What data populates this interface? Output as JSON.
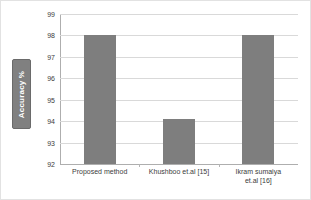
{
  "chart_data": {
    "type": "bar",
    "title": "",
    "xlabel": "",
    "ylabel": "Accuracy %",
    "categories": [
      "Proposed method",
      "Khushboo et.al [15]",
      "Ikram sumaiya et.al [16]"
    ],
    "category_lines": [
      [
        "Proposed method"
      ],
      [
        "Khushboo et.al [15]"
      ],
      [
        "Ikram sumaiya",
        "et.al [16]"
      ]
    ],
    "values": [
      98,
      94.1,
      98
    ],
    "ylim": [
      92,
      99
    ],
    "yticks": [
      99,
      98,
      97,
      96,
      95,
      94,
      93,
      92
    ],
    "ytick_labels": [
      "99",
      "98",
      "97",
      "96",
      "95",
      "94",
      "93",
      "92"
    ],
    "grid": true,
    "legend": false,
    "bar_color": "#7e7e7e",
    "gridline_color": "#d9d9d9",
    "axis_color": "#aeaeae",
    "ylabel_box_color": "#808080",
    "ylabel_text_color": "#ffffff"
  }
}
